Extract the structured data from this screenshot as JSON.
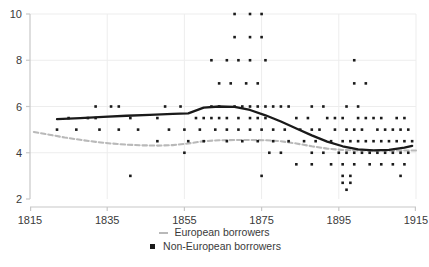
{
  "chart_data": {
    "type": "scatter",
    "title": "",
    "xlabel": "",
    "ylabel": "",
    "xlim": [
      1815,
      1915
    ],
    "ylim": [
      2,
      10
    ],
    "xticks": [
      1815,
      1835,
      1855,
      1875,
      1895,
      1915
    ],
    "xticklabels": [
      "1815",
      "1835",
      "1855",
      "1875",
      "1895",
      "1915"
    ],
    "yticks": [
      2,
      4,
      6,
      8,
      10
    ],
    "yticklabels": [
      "2",
      "4",
      "6",
      "8",
      "10"
    ],
    "grid": true,
    "legend_position": "bottom-center",
    "colors": {
      "european_line": "#b9b9b9",
      "non_european_line": "#1a1a1a",
      "marker": "#1a1a1a",
      "grid": "#ededed",
      "axis": "#c8c8c8",
      "text": "#3a3a3a"
    },
    "series": [
      {
        "name": "European borrowers",
        "type": "line",
        "style": "dashed",
        "color": "#b9b9b9",
        "x": [
          1816,
          1820,
          1824,
          1828,
          1832,
          1836,
          1840,
          1844,
          1848,
          1852,
          1856,
          1860,
          1864,
          1868,
          1872,
          1876,
          1880,
          1884,
          1888,
          1892,
          1896,
          1900,
          1904,
          1908,
          1912,
          1915
        ],
        "values": [
          4.9,
          4.78,
          4.66,
          4.56,
          4.47,
          4.4,
          4.35,
          4.32,
          4.31,
          4.33,
          4.4,
          4.5,
          4.54,
          4.55,
          4.55,
          4.54,
          4.5,
          4.4,
          4.28,
          4.18,
          4.12,
          4.1,
          4.09,
          4.09,
          4.1,
          4.1
        ]
      },
      {
        "name": "Non-European borrowers",
        "type": "line",
        "style": "solid",
        "color": "#1a1a1a",
        "x": [
          1822,
          1828,
          1834,
          1840,
          1846,
          1852,
          1856,
          1860,
          1864,
          1868,
          1872,
          1876,
          1880,
          1884,
          1888,
          1892,
          1896,
          1900,
          1904,
          1908,
          1912,
          1914
        ],
        "values": [
          5.45,
          5.5,
          5.55,
          5.6,
          5.64,
          5.68,
          5.7,
          5.95,
          6.0,
          5.98,
          5.85,
          5.62,
          5.35,
          5.05,
          4.75,
          4.48,
          4.28,
          4.15,
          4.1,
          4.12,
          4.22,
          4.3
        ]
      }
    ],
    "scatter": {
      "name": "Non-European borrowers",
      "marker": "square",
      "color": "#1a1a1a",
      "points": [
        [
          1868,
          10
        ],
        [
          1872,
          10
        ],
        [
          1875,
          10
        ],
        [
          1868,
          9
        ],
        [
          1872,
          9
        ],
        [
          1875,
          9
        ],
        [
          1862,
          8
        ],
        [
          1866,
          8
        ],
        [
          1869,
          8
        ],
        [
          1872,
          8
        ],
        [
          1876,
          8
        ],
        [
          1899,
          8
        ],
        [
          1864,
          7
        ],
        [
          1867,
          7
        ],
        [
          1871,
          7
        ],
        [
          1874,
          7
        ],
        [
          1899,
          7
        ],
        [
          1902,
          7
        ],
        [
          1832,
          6
        ],
        [
          1836,
          6
        ],
        [
          1838,
          6
        ],
        [
          1850,
          6
        ],
        [
          1854,
          6
        ],
        [
          1862,
          6
        ],
        [
          1864,
          6
        ],
        [
          1868,
          6
        ],
        [
          1870,
          6
        ],
        [
          1872,
          6
        ],
        [
          1874,
          6
        ],
        [
          1876,
          6
        ],
        [
          1878,
          6
        ],
        [
          1880,
          6
        ],
        [
          1882,
          6
        ],
        [
          1888,
          6
        ],
        [
          1891,
          6
        ],
        [
          1897,
          6
        ],
        [
          1900,
          6
        ],
        [
          1825,
          5.5
        ],
        [
          1830,
          5.5
        ],
        [
          1832,
          5.5
        ],
        [
          1841,
          5.5
        ],
        [
          1848,
          5.5
        ],
        [
          1858,
          5.5
        ],
        [
          1860,
          5.5
        ],
        [
          1862,
          5.5
        ],
        [
          1864,
          5.5
        ],
        [
          1866,
          5.5
        ],
        [
          1869,
          5.5
        ],
        [
          1872,
          5.5
        ],
        [
          1874,
          5.5
        ],
        [
          1876,
          5.5
        ],
        [
          1884,
          5.5
        ],
        [
          1887,
          5.5
        ],
        [
          1892,
          5.5
        ],
        [
          1894,
          5.5
        ],
        [
          1896,
          5.5
        ],
        [
          1900,
          5.5
        ],
        [
          1902,
          5.5
        ],
        [
          1904,
          5.5
        ],
        [
          1906,
          5.5
        ],
        [
          1910,
          5.5
        ],
        [
          1912,
          5.5
        ],
        [
          1822,
          5
        ],
        [
          1827,
          5
        ],
        [
          1833,
          5
        ],
        [
          1838,
          5
        ],
        [
          1843,
          5
        ],
        [
          1851,
          5
        ],
        [
          1855,
          5
        ],
        [
          1859,
          5
        ],
        [
          1863,
          5
        ],
        [
          1866,
          5
        ],
        [
          1869,
          5
        ],
        [
          1872,
          5
        ],
        [
          1875,
          5
        ],
        [
          1878,
          5
        ],
        [
          1881,
          5
        ],
        [
          1885,
          5
        ],
        [
          1888,
          5
        ],
        [
          1890,
          5
        ],
        [
          1894,
          5
        ],
        [
          1897,
          5
        ],
        [
          1899,
          5
        ],
        [
          1901,
          5
        ],
        [
          1905,
          5
        ],
        [
          1907,
          5
        ],
        [
          1909,
          5
        ],
        [
          1911,
          5
        ],
        [
          1913,
          5
        ],
        [
          1848,
          4.5
        ],
        [
          1856,
          4.5
        ],
        [
          1860,
          4.5
        ],
        [
          1866,
          4.5
        ],
        [
          1870,
          4.5
        ],
        [
          1874,
          4.5
        ],
        [
          1878,
          4.5
        ],
        [
          1882,
          4.5
        ],
        [
          1886,
          4.5
        ],
        [
          1889,
          4.5
        ],
        [
          1893,
          4.5
        ],
        [
          1896,
          4.5
        ],
        [
          1898,
          4.5
        ],
        [
          1900,
          4.5
        ],
        [
          1902,
          4.5
        ],
        [
          1904,
          4.5
        ],
        [
          1906,
          4.5
        ],
        [
          1908,
          4.5
        ],
        [
          1910,
          4.5
        ],
        [
          1912,
          4.5
        ],
        [
          1914,
          4.5
        ],
        [
          1855,
          4
        ],
        [
          1877,
          4
        ],
        [
          1880,
          4
        ],
        [
          1888,
          4
        ],
        [
          1891,
          4
        ],
        [
          1895,
          4
        ],
        [
          1897,
          4
        ],
        [
          1899,
          4
        ],
        [
          1901,
          4
        ],
        [
          1903,
          4
        ],
        [
          1905,
          4
        ],
        [
          1907,
          4
        ],
        [
          1909,
          4
        ],
        [
          1911,
          4
        ],
        [
          1913,
          4
        ],
        [
          1884,
          3.5
        ],
        [
          1888,
          3.5
        ],
        [
          1893,
          3.5
        ],
        [
          1896,
          3.5
        ],
        [
          1899,
          3.5
        ],
        [
          1903,
          3.5
        ],
        [
          1906,
          3.5
        ],
        [
          1909,
          3.5
        ],
        [
          1912,
          3.5
        ],
        [
          1841,
          3
        ],
        [
          1875,
          3
        ],
        [
          1896,
          3
        ],
        [
          1898,
          3
        ],
        [
          1911,
          3
        ],
        [
          1896,
          2.7
        ],
        [
          1898,
          2.7
        ],
        [
          1897,
          2.4
        ]
      ]
    }
  },
  "legend": {
    "items": [
      {
        "label": "European borrowers",
        "marker": "dashed-line",
        "color": "#b9b9b9"
      },
      {
        "label": "Non-European borrowers",
        "marker": "square",
        "color": "#1a1a1a"
      }
    ]
  }
}
